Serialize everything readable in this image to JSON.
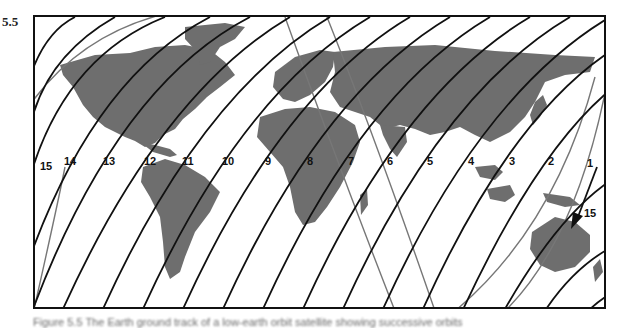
{
  "figure": {
    "number": "5.5",
    "caption": "Figure 5.5 The Earth ground track of a low-earth orbit satellite showing successive orbits"
  },
  "map": {
    "land_color": "#6e6e6e",
    "track_color": "#111111",
    "highlight_track_color": "#777777",
    "track_labels": [
      {
        "label": "15",
        "x": 5,
        "y": 143
      },
      {
        "label": "14",
        "x": 29,
        "y": 138
      },
      {
        "label": "13",
        "x": 68,
        "y": 138
      },
      {
        "label": "12",
        "x": 109,
        "y": 138
      },
      {
        "label": "11",
        "x": 147,
        "y": 138
      },
      {
        "label": "10",
        "x": 187,
        "y": 138
      },
      {
        "label": "9",
        "x": 230,
        "y": 138
      },
      {
        "label": "8",
        "x": 272,
        "y": 138
      },
      {
        "label": "7",
        "x": 313,
        "y": 138
      },
      {
        "label": "6",
        "x": 352,
        "y": 138
      },
      {
        "label": "5",
        "x": 392,
        "y": 138
      },
      {
        "label": "4",
        "x": 433,
        "y": 138
      },
      {
        "label": "3",
        "x": 474,
        "y": 138
      },
      {
        "label": "2",
        "x": 513,
        "y": 138
      },
      {
        "label": "1",
        "x": 552,
        "y": 140
      }
    ],
    "direction_arrow": {
      "label": "15",
      "x": 555,
      "y": 191
    }
  }
}
